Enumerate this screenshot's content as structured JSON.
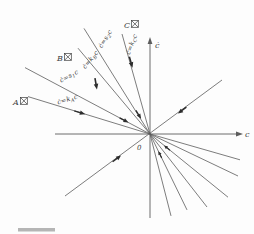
{
  "figure": {
    "background": "#fdfdfd",
    "ink": "#5c5c5c",
    "arrow_ink": "#2d2d2d",
    "text_ink": "#3e3e3e",
    "artifact_color": "#b5b5b5",
    "axes": {
      "x_label": "c",
      "y_label": "ċ",
      "origin_label": "0"
    },
    "regions": [
      {
        "id": "A",
        "label": "A区",
        "letter": "A"
      },
      {
        "id": "B",
        "label": "B区",
        "letter": "B"
      },
      {
        "id": "C",
        "label": "C区",
        "letter": "C"
      }
    ],
    "lines": [
      {
        "id": "kA",
        "label": "ċ=kAc",
        "pre": "ċ=k",
        "sub": "A",
        "post": "c"
      },
      {
        "id": "s1",
        "label": "ċ=s1c",
        "pre": "ċ=s",
        "sub": "1",
        "post": "c"
      },
      {
        "id": "kB",
        "label": "ċ=kBc",
        "pre": "ċ=k",
        "sub": "B",
        "post": "c"
      },
      {
        "id": "s2",
        "label": "ċ=s2c",
        "pre": "ċ=s",
        "sub": "2",
        "post": "c"
      },
      {
        "id": "kC",
        "label": "ċ=kCc",
        "pre": "ċ=k",
        "sub": "C",
        "post": "c"
      }
    ]
  }
}
